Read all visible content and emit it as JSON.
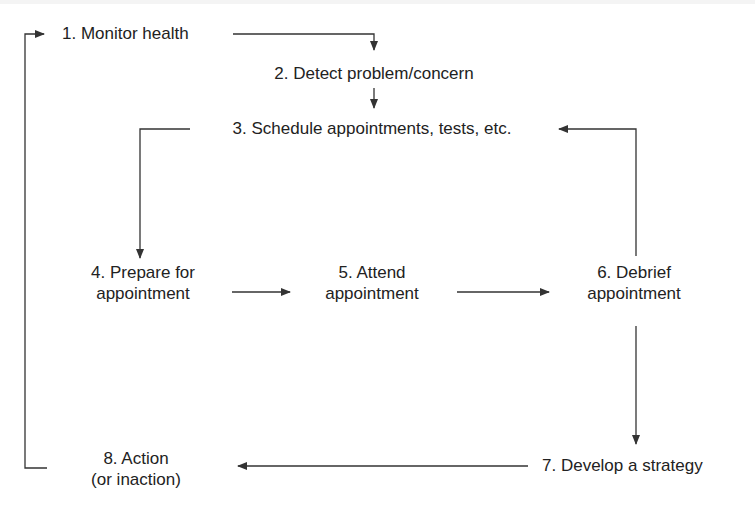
{
  "diagram": {
    "type": "cycle-flowchart",
    "colors": {
      "line": "#333333",
      "text": "#222222",
      "background": "#ffffff"
    },
    "nodes": [
      {
        "id": 1,
        "lines": [
          "1. Monitor health"
        ]
      },
      {
        "id": 2,
        "lines": [
          "2. Detect problem/concern"
        ]
      },
      {
        "id": 3,
        "lines": [
          "3. Schedule appointments, tests, etc."
        ]
      },
      {
        "id": 4,
        "lines": [
          "4. Prepare for",
          "appointment"
        ]
      },
      {
        "id": 5,
        "lines": [
          "5. Attend",
          "appointment"
        ]
      },
      {
        "id": 6,
        "lines": [
          "6. Debrief",
          "appointment"
        ]
      },
      {
        "id": 7,
        "lines": [
          "7. Develop a strategy"
        ]
      },
      {
        "id": 8,
        "lines": [
          "8. Action",
          "(or inaction)"
        ]
      }
    ],
    "edges": [
      {
        "from": 1,
        "to": 2
      },
      {
        "from": 2,
        "to": 3
      },
      {
        "from": 3,
        "to": 4
      },
      {
        "from": 4,
        "to": 5
      },
      {
        "from": 5,
        "to": 6
      },
      {
        "from": 6,
        "to": 3
      },
      {
        "from": 6,
        "to": 7
      },
      {
        "from": 7,
        "to": 8
      },
      {
        "from": 8,
        "to": 1
      }
    ]
  }
}
